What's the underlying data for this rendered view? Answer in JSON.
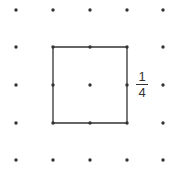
{
  "diagram": {
    "type": "dot-grid-with-square",
    "grid": {
      "columns": 5,
      "rows": 5,
      "x_positions": [
        16,
        53,
        90,
        127,
        163
      ],
      "y_positions": [
        10,
        47,
        85,
        123,
        160
      ],
      "dot_color": "#333333"
    },
    "square": {
      "corners": [
        [
          1,
          1
        ],
        [
          3,
          1
        ],
        [
          3,
          3
        ],
        [
          1,
          3
        ]
      ],
      "stroke_color": "#333333"
    },
    "label": {
      "numerator": "1",
      "denominator": "4"
    }
  }
}
